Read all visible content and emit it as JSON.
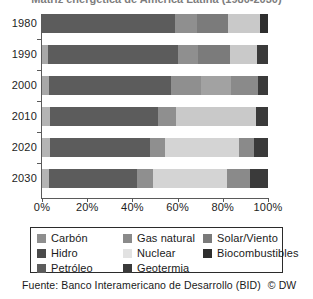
{
  "title": {
    "text": "Matriz energética de América Latina (1980-2030)",
    "cropped": true
  },
  "footer": {
    "source": "Fuente: Banco Interamericano de Desarrollo (BID)",
    "copyright": "© DW"
  },
  "legend": {
    "columns": [
      [
        "Carbón",
        "Hidro",
        "Petróleo"
      ],
      [
        "Gas natural",
        "Nuclear",
        "Geotermia"
      ],
      [
        "Solar/Viento",
        "Biocombustibles"
      ]
    ]
  },
  "colors": {
    "carbon": "#8e8e8e",
    "hidro": "#4a4a4a",
    "petroleo": "#5c5c5c",
    "gas_natural": "#8a8a8a",
    "nuclear": "#e2e2e2",
    "geotermia": "#3a3a3a",
    "solar_viento": "#7a7a7a",
    "biocombustibles": "#2e2e2e",
    "axis": "#5a5a5a",
    "text": "#1a1a1a",
    "background": "#ffffff"
  },
  "chart_data": {
    "type": "bar",
    "orientation": "horizontal",
    "stacked": true,
    "normalized": true,
    "title": "Matriz energética de América Latina (1980-2030)",
    "xlabel": "",
    "ylabel": "",
    "xlim": [
      0,
      100
    ],
    "xticks": [
      "0%",
      "20%",
      "40%",
      "60%",
      "80%",
      "100%"
    ],
    "xtick_values": [
      0,
      20,
      40,
      60,
      80,
      100
    ],
    "grid": false,
    "legend_position": "bottom",
    "categories": [
      "1980",
      "1990",
      "2000",
      "2010",
      "2020",
      "2030"
    ],
    "series": [
      {
        "name": "Carbón",
        "color": "#8e8e8e",
        "values": [
          0.0,
          2.5,
          3.0,
          3.5,
          3.5,
          3.0
        ]
      },
      {
        "name": "Petróleo",
        "color": "#5c5c5c",
        "values": [
          59.0,
          57.5,
          54.0,
          48.0,
          44.5,
          39.0
        ]
      },
      {
        "name": "Gas natural",
        "color": "#8a8a8a",
        "values": [
          9.5,
          9.0,
          13.5,
          8.0,
          6.5,
          7.0
        ]
      },
      {
        "name": "Hidro",
        "color": "#9a9a9a",
        "values": [
          14.0,
          14.0,
          13.0,
          5.0,
          0.0,
          0.0
        ]
      },
      {
        "name": "Nuclear",
        "color": "#e2e2e2",
        "values": [
          14.0,
          12.0,
          12.0,
          30.0,
          32.5,
          33.0
        ]
      },
      {
        "name": "Solar/Viento",
        "color": "#7a7a7a",
        "values": [
          0.0,
          0.0,
          0.0,
          0.0,
          7.0,
          10.0
        ]
      },
      {
        "name": "Biocombustibles",
        "color": "#2e2e2e",
        "values": [
          3.5,
          5.0,
          4.5,
          5.5,
          6.0,
          8.0
        ]
      }
    ],
    "rows": [
      {
        "year": "1980",
        "segments": [
          {
            "name": "Petróleo",
            "value": 59.0,
            "color": "#5c5c5c"
          },
          {
            "name": "Gas natural",
            "value": 9.5,
            "color": "#8f8f8f"
          },
          {
            "name": "Hidro",
            "value": 14.0,
            "color": "#7b7b7b"
          },
          {
            "name": "Nuclear",
            "value": 14.0,
            "color": "#c9c9c9"
          },
          {
            "name": "Biocombustibles",
            "value": 3.5,
            "color": "#2e2e2e"
          }
        ]
      },
      {
        "year": "1990",
        "segments": [
          {
            "name": "Carbón",
            "value": 2.5,
            "color": "#a8a8a8"
          },
          {
            "name": "Petróleo",
            "value": 57.5,
            "color": "#5c5c5c"
          },
          {
            "name": "Gas natural",
            "value": 9.0,
            "color": "#8f8f8f"
          },
          {
            "name": "Hidro",
            "value": 14.0,
            "color": "#7b7b7b"
          },
          {
            "name": "Nuclear",
            "value": 12.0,
            "color": "#c9c9c9"
          },
          {
            "name": "Biocombustibles",
            "value": 5.0,
            "color": "#3a3a3a"
          }
        ]
      },
      {
        "year": "2000",
        "segments": [
          {
            "name": "Carbón",
            "value": 3.0,
            "color": "#a8a8a8"
          },
          {
            "name": "Petróleo",
            "value": 54.0,
            "color": "#5c5c5c"
          },
          {
            "name": "Gas natural",
            "value": 13.5,
            "color": "#8f8f8f"
          },
          {
            "name": "Hidro",
            "value": 13.0,
            "color": "#a2a2a2"
          },
          {
            "name": "Nuclear",
            "value": 12.0,
            "color": "#8a8a8a"
          },
          {
            "name": "Biocombustibles",
            "value": 4.5,
            "color": "#3a3a3a"
          }
        ]
      },
      {
        "year": "2010",
        "segments": [
          {
            "name": "Carbón",
            "value": 3.5,
            "color": "#b4b4b4"
          },
          {
            "name": "Petróleo",
            "value": 48.0,
            "color": "#5c5c5c"
          },
          {
            "name": "Gas natural",
            "value": 8.0,
            "color": "#8f8f8f"
          },
          {
            "name": "Nuclear",
            "value": 35.0,
            "color": "#c9c9c9"
          },
          {
            "name": "Biocombustibles",
            "value": 5.5,
            "color": "#3a3a3a"
          }
        ]
      },
      {
        "year": "2020",
        "segments": [
          {
            "name": "Carbón",
            "value": 3.5,
            "color": "#b4b4b4"
          },
          {
            "name": "Petróleo",
            "value": 44.5,
            "color": "#5c5c5c"
          },
          {
            "name": "Gas natural",
            "value": 6.5,
            "color": "#8f8f8f"
          },
          {
            "name": "Nuclear",
            "value": 32.5,
            "color": "#d4d4d4"
          },
          {
            "name": "Solar/Viento",
            "value": 7.0,
            "color": "#8a8a8a"
          },
          {
            "name": "Biocombustibles",
            "value": 6.0,
            "color": "#3a3a3a"
          }
        ]
      },
      {
        "year": "2030",
        "segments": [
          {
            "name": "Carbón",
            "value": 3.0,
            "color": "#b4b4b4"
          },
          {
            "name": "Petróleo",
            "value": 39.0,
            "color": "#5c5c5c"
          },
          {
            "name": "Gas natural",
            "value": 7.0,
            "color": "#8f8f8f"
          },
          {
            "name": "Nuclear",
            "value": 33.0,
            "color": "#d4d4d4"
          },
          {
            "name": "Solar/Viento",
            "value": 10.0,
            "color": "#8a8a8a"
          },
          {
            "name": "Biocombustibles",
            "value": 8.0,
            "color": "#3a3a3a"
          }
        ]
      }
    ]
  }
}
